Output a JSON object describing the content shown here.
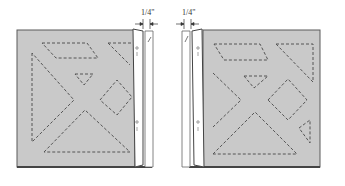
{
  "diagram": {
    "panels": [
      {
        "id": "left",
        "measurement_label": "1/4\""
      },
      {
        "id": "right",
        "measurement_label": "1/4\""
      }
    ],
    "colors": {
      "quilt_fill": "#c9c9c9",
      "quilt_border": "#5a5a5a",
      "binding_fill": "#ffffff",
      "stitch": "#555555"
    }
  }
}
